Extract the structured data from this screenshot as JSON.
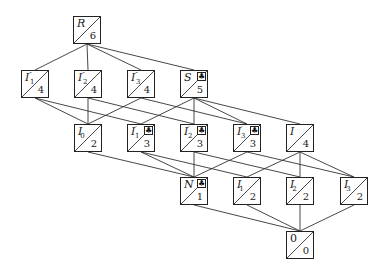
{
  "diagram": {
    "type": "lattice",
    "nodes": [
      {
        "id": "R",
        "label": "R",
        "prime": "",
        "sub": "",
        "value": "6",
        "x": 73,
        "y": 16,
        "club": false
      },
      {
        "id": "I1pp",
        "label": "I",
        "prime": "″",
        "sub": "1",
        "value": "4",
        "x": 21,
        "y": 70,
        "club": false
      },
      {
        "id": "I2pp",
        "label": "I",
        "prime": "″",
        "sub": "2",
        "value": "4",
        "x": 74,
        "y": 70,
        "club": false
      },
      {
        "id": "I3pp",
        "label": "I",
        "prime": "″",
        "sub": "3",
        "value": "4",
        "x": 127,
        "y": 70,
        "club": false
      },
      {
        "id": "S",
        "label": "S",
        "prime": "",
        "sub": "",
        "value": "5",
        "x": 180,
        "y": 70,
        "club": true
      },
      {
        "id": "I0",
        "label": "I",
        "prime": "",
        "sub": "0",
        "value": "2",
        "x": 74,
        "y": 124,
        "club": false
      },
      {
        "id": "I1p",
        "label": "I",
        "prime": "′",
        "sub": "1",
        "value": "3",
        "x": 127,
        "y": 124,
        "club": true
      },
      {
        "id": "I2p",
        "label": "I",
        "prime": "′",
        "sub": "2",
        "value": "3",
        "x": 180,
        "y": 124,
        "club": true
      },
      {
        "id": "I3p",
        "label": "I",
        "prime": "′",
        "sub": "3",
        "value": "3",
        "x": 233,
        "y": 124,
        "club": true
      },
      {
        "id": "I",
        "label": "I",
        "prime": "",
        "sub": "",
        "value": "4",
        "x": 286,
        "y": 124,
        "club": false
      },
      {
        "id": "N",
        "label": "N",
        "prime": "",
        "sub": "",
        "value": "1",
        "x": 180,
        "y": 177,
        "club": true
      },
      {
        "id": "I1",
        "label": "I",
        "prime": "",
        "sub": "1",
        "value": "2",
        "x": 233,
        "y": 177,
        "club": false
      },
      {
        "id": "I2",
        "label": "I",
        "prime": "",
        "sub": "2",
        "value": "2",
        "x": 286,
        "y": 177,
        "club": false
      },
      {
        "id": "I3",
        "label": "I",
        "prime": "",
        "sub": "3",
        "value": "2",
        "x": 340,
        "y": 177,
        "club": false
      },
      {
        "id": "Z",
        "label": "0",
        "prime": "",
        "sub": "",
        "value": "0",
        "x": 286,
        "y": 231,
        "club": false,
        "upright": true
      }
    ],
    "edges": [
      [
        "R",
        "I1pp"
      ],
      [
        "R",
        "I2pp"
      ],
      [
        "R",
        "I3pp"
      ],
      [
        "R",
        "S"
      ],
      [
        "I1pp",
        "I0"
      ],
      [
        "I1pp",
        "I1p"
      ],
      [
        "I2pp",
        "I0"
      ],
      [
        "I2pp",
        "I2p"
      ],
      [
        "I3pp",
        "I0"
      ],
      [
        "I3pp",
        "I3p"
      ],
      [
        "S",
        "I1p"
      ],
      [
        "S",
        "I2p"
      ],
      [
        "S",
        "I3p"
      ],
      [
        "S",
        "I"
      ],
      [
        "I0",
        "N"
      ],
      [
        "I1p",
        "N"
      ],
      [
        "I1p",
        "I1"
      ],
      [
        "I2p",
        "N"
      ],
      [
        "I2p",
        "I2"
      ],
      [
        "I3p",
        "N"
      ],
      [
        "I3p",
        "I3"
      ],
      [
        "I",
        "I1"
      ],
      [
        "I",
        "I2"
      ],
      [
        "I",
        "I3"
      ],
      [
        "N",
        "Z"
      ],
      [
        "I1",
        "Z"
      ],
      [
        "I2",
        "Z"
      ],
      [
        "I3",
        "Z"
      ]
    ],
    "club_symbol": "♣",
    "colors": {
      "line": "#333333",
      "border": "#222222",
      "background": "#ffffff"
    }
  }
}
